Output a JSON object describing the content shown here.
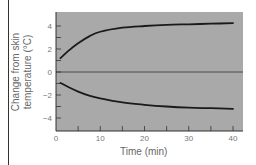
{
  "chart_data": {
    "type": "line",
    "title": "",
    "xlabel": "Time (min)",
    "ylabel": "Change from skin temperature (°C)",
    "ylabel_lines": [
      "Change from skin",
      "temperature (°C)"
    ],
    "xlim": [
      0,
      42
    ],
    "ylim": [
      -5,
      5
    ],
    "xticks": [
      0,
      10,
      20,
      30,
      40
    ],
    "xtick_minor_step": 5,
    "yticks": [
      4,
      2,
      0,
      -2,
      -4
    ],
    "ytick_labels": [
      "4",
      "2",
      "0",
      "−2",
      "−4"
    ],
    "ytick_minor_step": 1,
    "grid": false,
    "zero_line": true,
    "plot_background": "#a9a9a9",
    "line_color": "#1a1a1a",
    "legend": null,
    "series": [
      {
        "name": "upper curve",
        "x": [
          1,
          3,
          5,
          7.5,
          10,
          15,
          20,
          25,
          30,
          35,
          40
        ],
        "y": [
          1.2,
          1.9,
          2.5,
          3.1,
          3.5,
          3.85,
          4.0,
          4.1,
          4.15,
          4.2,
          4.25
        ]
      },
      {
        "name": "lower curve",
        "x": [
          1,
          3,
          5,
          7.5,
          10,
          15,
          20,
          25,
          30,
          35,
          40
        ],
        "y": [
          -0.95,
          -1.35,
          -1.7,
          -2.05,
          -2.3,
          -2.65,
          -2.85,
          -3.0,
          -3.1,
          -3.15,
          -3.2
        ]
      }
    ]
  }
}
